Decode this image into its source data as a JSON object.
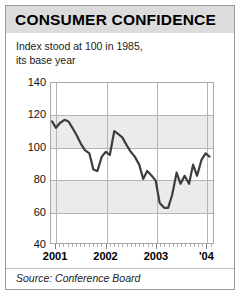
{
  "header": {
    "title": "CONSUMER CONFIDENCE"
  },
  "subtitle": {
    "line1": "Index stood at 100 in 1985,",
    "line2": "its base year"
  },
  "footer": {
    "source": "Source: Conference Board"
  },
  "colors": {
    "title_band": "#dcdcdc",
    "line": "#3d3d3d",
    "band": "#ebebeb",
    "grid": "#b4b4b4",
    "frame": "#9a9a9a"
  },
  "chart_data": {
    "type": "line",
    "title": "CONSUMER CONFIDENCE",
    "subtitle": "Index stood at 100 in 1985, its base year",
    "source": "Source: Conference Board",
    "xlabel": "",
    "ylabel": "",
    "ylim": [
      40,
      140
    ],
    "yticks": [
      40,
      60,
      80,
      100,
      120,
      140
    ],
    "ytick_labels": [
      "40",
      "60",
      "80",
      "100",
      "120",
      "140"
    ],
    "xlim": [
      2000.9,
      2004.15
    ],
    "xticks": [
      2001,
      2002,
      2003,
      2004
    ],
    "xtick_labels": [
      "2001",
      "2002",
      "2003",
      "'04"
    ],
    "grid": true,
    "legend": false,
    "minor_tick_interval_months": 1,
    "series": [
      {
        "name": "Consumer Confidence Index",
        "x": [
          2000.92,
          2001.0,
          2001.08,
          2001.17,
          2001.25,
          2001.33,
          2001.42,
          2001.5,
          2001.58,
          2001.67,
          2001.75,
          2001.83,
          2001.92,
          2002.0,
          2002.08,
          2002.17,
          2002.25,
          2002.33,
          2002.42,
          2002.5,
          2002.58,
          2002.67,
          2002.75,
          2002.83,
          2002.92,
          2003.0,
          2003.08,
          2003.17,
          2003.25,
          2003.33,
          2003.42,
          2003.5,
          2003.58,
          2003.67,
          2003.75,
          2003.83,
          2003.92,
          2004.0,
          2004.08
        ],
        "values": [
          116,
          112,
          115,
          117,
          116,
          112,
          107,
          102,
          98,
          96,
          86,
          85,
          94,
          97,
          95,
          110,
          108,
          106,
          101,
          97,
          94,
          89,
          80,
          85,
          82,
          79,
          65,
          62,
          62,
          70,
          84,
          77,
          82,
          77,
          89,
          82,
          92,
          96,
          94
        ]
      }
    ]
  }
}
